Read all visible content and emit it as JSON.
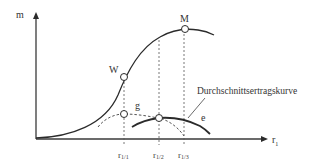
{
  "diagram": {
    "axes": {
      "y_label": "m",
      "x_label_base": "r",
      "x_label_sub": "1"
    },
    "points": {
      "W": "W",
      "M": "M",
      "g": "g",
      "e": "e"
    },
    "curve_label": "Durchschnittsertragskurve",
    "ticks": [
      {
        "base": "r",
        "sub": "1/1"
      },
      {
        "base": "r",
        "sub": "1/2"
      },
      {
        "base": "r",
        "sub": "1/3"
      }
    ],
    "colors": {
      "line": "#2b2b2b",
      "axis": "#3a3a3a",
      "text": "#333333",
      "background": "#ffffff"
    }
  }
}
